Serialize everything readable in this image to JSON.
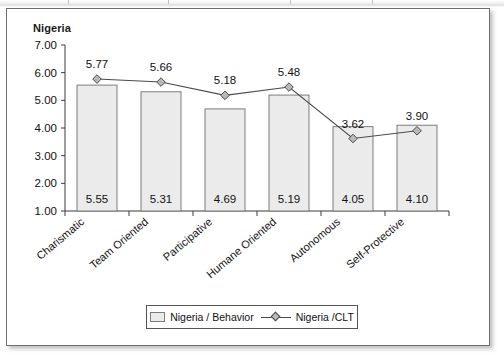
{
  "figure": {
    "title": "Nigeria",
    "frame_border_color": "#6e6e6e",
    "background": "#ffffff"
  },
  "legend": {
    "position": "bottom-center",
    "entries": [
      {
        "label": "Nigeria / Behavior",
        "marker": "bar-swatch-icon",
        "color": "#ebebeb"
      },
      {
        "label": "Nigeria /CLT",
        "marker": "line-diamond-icon",
        "color": "#4a4a4a"
      }
    ]
  },
  "chart_data": {
    "type": "bar",
    "title": "Nigeria",
    "xlabel": "",
    "ylabel": "",
    "ylim": [
      1.0,
      7.0
    ],
    "ytick_step": 1.0,
    "yticks": [
      "1.00",
      "2.00",
      "3.00",
      "4.00",
      "5.00",
      "6.00",
      "7.00"
    ],
    "grid": false,
    "categories": [
      "Charismatic",
      "Team Oriented",
      "Participative",
      "Humane Oriented",
      "Autonomous",
      "Self-Protective"
    ],
    "series": [
      {
        "name": "Nigeria / Behavior",
        "type": "bar",
        "values": [
          5.55,
          5.31,
          4.69,
          5.19,
          4.05,
          4.1
        ],
        "labels": [
          "5.55",
          "5.31",
          "4.69",
          "5.19",
          "4.05",
          "4.10"
        ],
        "label_position": "inside-bottom",
        "fill": "#ebebeb",
        "stroke": "#7d7d7d"
      },
      {
        "name": "Nigeria /CLT",
        "type": "line",
        "values": [
          5.77,
          5.66,
          5.18,
          5.48,
          3.62,
          3.9
        ],
        "labels": [
          "5.77",
          "5.66",
          "5.18",
          "5.48",
          "3.62",
          "3.90"
        ],
        "label_position": "above-marker",
        "stroke": "#4a4a4a",
        "marker": "diamond",
        "marker_fill": "#b9b9b9"
      }
    ]
  }
}
